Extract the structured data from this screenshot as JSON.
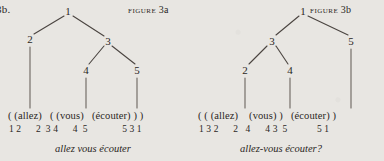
{
  "page": {
    "background_color": "#e8e6e2",
    "ink_color": "#2b2724",
    "item_label": "3b."
  },
  "figures": [
    {
      "id": "figure-3a",
      "label_smallcaps": "FIGURE",
      "label_number": "3a",
      "tree": {
        "nodes": [
          {
            "name": "1",
            "x": 68,
            "y": 11
          },
          {
            "name": "2",
            "x": 30,
            "y": 39
          },
          {
            "name": "3",
            "x": 108,
            "y": 41
          },
          {
            "name": "4",
            "x": 86,
            "y": 70
          },
          {
            "name": "5",
            "x": 137,
            "y": 70
          }
        ],
        "edges": [
          {
            "from": "1",
            "to": "2"
          },
          {
            "from": "1",
            "to": "3"
          },
          {
            "from": "3",
            "to": "4"
          },
          {
            "from": "3",
            "to": "5"
          }
        ],
        "stems": [
          {
            "from": "2",
            "x": 30,
            "y1": 47,
            "y2": 108
          },
          {
            "from": "4",
            "x": 86,
            "y1": 78,
            "y2": 108
          },
          {
            "from": "5",
            "x": 137,
            "y1": 78,
            "y2": 108
          }
        ]
      },
      "bracket_row": "( (allez)   ( (vous)   (écouter) ) )",
      "number_row": "1 2      2  3 4      4  5              5 3 1",
      "caption": "allez vous écouter"
    },
    {
      "id": "figure-3b",
      "label_smallcaps": "FIGURE",
      "label_number": "3b",
      "tree": {
        "nodes": [
          {
            "name": "1",
            "x": 111,
            "y": 11
          },
          {
            "name": "3",
            "x": 80,
            "y": 41
          },
          {
            "name": "5",
            "x": 159,
            "y": 41
          },
          {
            "name": "2",
            "x": 53,
            "y": 70
          },
          {
            "name": "4",
            "x": 98,
            "y": 70
          }
        ],
        "edges": [
          {
            "from": "1",
            "to": "3"
          },
          {
            "from": "1",
            "to": "5"
          },
          {
            "from": "3",
            "to": "2"
          },
          {
            "from": "3",
            "to": "4"
          }
        ],
        "stems": [
          {
            "from": "2",
            "x": 53,
            "y1": 78,
            "y2": 108
          },
          {
            "from": "4",
            "x": 98,
            "y1": 78,
            "y2": 108
          },
          {
            "from": "5",
            "x": 159,
            "y1": 49,
            "y2": 108
          }
        ]
      },
      "bracket_row": "( ( (allez)    (vous) )   (écouter) )",
      "number_row": "1 3 2      2   4      4 3  5            5 1",
      "caption": "allez-vous écouter?"
    }
  ]
}
